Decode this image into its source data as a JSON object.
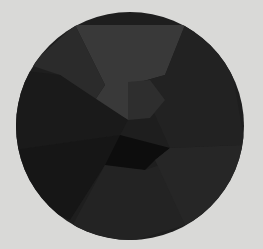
{
  "image": {
    "description": "Dark faceted circular disc on light gray background",
    "background_color": "#d9d9d7",
    "disc": {
      "center": [
        130,
        126
      ],
      "radius": 114,
      "base_color": "#1e1e1e"
    },
    "facets": [
      {
        "name": "top-wedge",
        "color": "#393939",
        "points": "75,25 185,25 165,75 140,82 128,120 95,100 105,85"
      },
      {
        "name": "upper-left-wedge",
        "color": "#2b2b2b",
        "points": "30,65 75,25 105,85 95,100 60,75"
      },
      {
        "name": "left-band",
        "color": "#1a1a1a",
        "points": "15,70 60,75 128,120 120,135 15,150"
      },
      {
        "name": "lower-left",
        "color": "#161616",
        "points": "15,150 120,135 105,165 70,220 20,200"
      },
      {
        "name": "bottom-center",
        "color": "#0d0d0d",
        "points": "105,165 120,135 170,148 155,160 145,170 110,168"
      },
      {
        "name": "bottom-wedge",
        "color": "#232323",
        "points": "70,230 105,165 145,170 160,165 185,225 130,242"
      },
      {
        "name": "right-upper",
        "color": "#222222",
        "points": "165,75 185,25 230,60 245,145 170,148 140,82"
      },
      {
        "name": "right-lower",
        "color": "#262626",
        "points": "170,148 245,145 230,200 185,225 155,160"
      },
      {
        "name": "center-notch",
        "color": "#2e2e2e",
        "points": "128,82 150,80 165,100 150,118 128,120"
      }
    ]
  }
}
